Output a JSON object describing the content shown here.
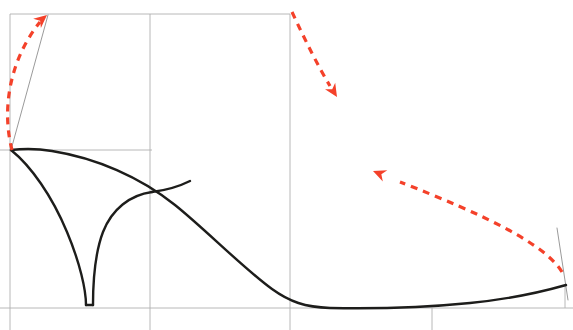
{
  "document": {
    "title": "Shoe Heel Profile Technical Sketch",
    "type": "line-drawing",
    "width": 573,
    "height": 330,
    "background_color": "#ffffff"
  },
  "palette": {
    "outline_color": "#1d1d1b",
    "construction_line_color": "#9a9a9a",
    "grid_line_color": "#b4b4b4",
    "annotation_color": "#f4412a",
    "background_color": "#ffffff"
  },
  "geometry": {
    "grid": {
      "stroke": "#b0b0b0",
      "stroke_width": 0.9,
      "lines": [
        {
          "name": "top-horizontal-rule",
          "x1": 10,
          "y1": 14,
          "x2": 290,
          "y2": 14
        },
        {
          "name": "left-vertical-rule",
          "x1": 10,
          "y1": 14,
          "x2": 10,
          "y2": 330
        },
        {
          "name": "mid-vertical-rule",
          "x1": 150,
          "y1": 14,
          "x2": 150,
          "y2": 330
        },
        {
          "name": "ball-vertical-rule",
          "x1": 290,
          "y1": 14,
          "x2": 290,
          "y2": 330
        },
        {
          "name": "heel-top-horizontal-rule",
          "x1": 0,
          "y1": 150,
          "x2": 152,
          "y2": 150
        },
        {
          "name": "ground-baseline-rule",
          "x1": 0,
          "y1": 308,
          "x2": 573,
          "y2": 308
        },
        {
          "name": "toe-tick-vertical-rule",
          "x1": 432,
          "y1": 308,
          "x2": 432,
          "y2": 330
        },
        {
          "name": "toe-edge-vertical-rule",
          "x1": 565,
          "y1": 285,
          "x2": 565,
          "y2": 308
        }
      ]
    },
    "construction": {
      "stroke": "#8f8f8f",
      "stroke_width": 0.9,
      "lines": [
        {
          "name": "heel-pitch-line",
          "x1": 11,
          "y1": 150,
          "x2": 48,
          "y2": 15
        },
        {
          "name": "toe-spring-line",
          "x1": 557,
          "y1": 228,
          "x2": 568,
          "y2": 300
        }
      ]
    },
    "outline": {
      "stroke": "#1d1d1b",
      "stroke_width": 2.4,
      "paths": [
        {
          "name": "topline-and-sole-profile",
          "d": "M 11 150 C 20 149 34 148 52 151 C 96 158 140 177 175 205 C 205 229 243 268 272 289 C 290 302 305 307 330 308 C 380 309 430 307 470 303 C 510 299 545 291 566 285"
        },
        {
          "name": "heel-front-curve",
          "d": "M 11 150 C 31 166 52 196 67 232 C 80 263 86 290 86 305"
        },
        {
          "name": "heel-back-curve",
          "d": "M 152 192 C 130 195 112 209 103 232 C 95 253 93 282 93 305"
        },
        {
          "name": "heel-breast-bottom",
          "d": "M 86 305 L 93 305"
        },
        {
          "name": "heel-seat-to-waist",
          "d": "M 152 192 C 168 190 180 186 190 181"
        }
      ]
    },
    "annotations": {
      "stroke": "#f4412a",
      "stroke_width": 3.2,
      "dash_pattern": "7 6",
      "arrows": [
        {
          "name": "heel-height-arrow",
          "label": "heel height / pitch direction",
          "path": "M 12 150 C 2 112 8 62 40 22",
          "tip_x": 47,
          "tip_y": 15,
          "tip_angle": -40
        },
        {
          "name": "instep-drop-arrow",
          "label": "instep drop direction",
          "path": "M 292 12 C 305 40 318 66 330 86",
          "tip_x": 337,
          "tip_y": 97,
          "tip_angle": 58
        },
        {
          "name": "toe-spring-lift-arrow",
          "label": "toe spring lift direction",
          "path": "M 562 272 C 545 244 485 215 400 182",
          "tip_x": 373,
          "tip_y": 171,
          "tip_angle": 202
        }
      ]
    }
  }
}
